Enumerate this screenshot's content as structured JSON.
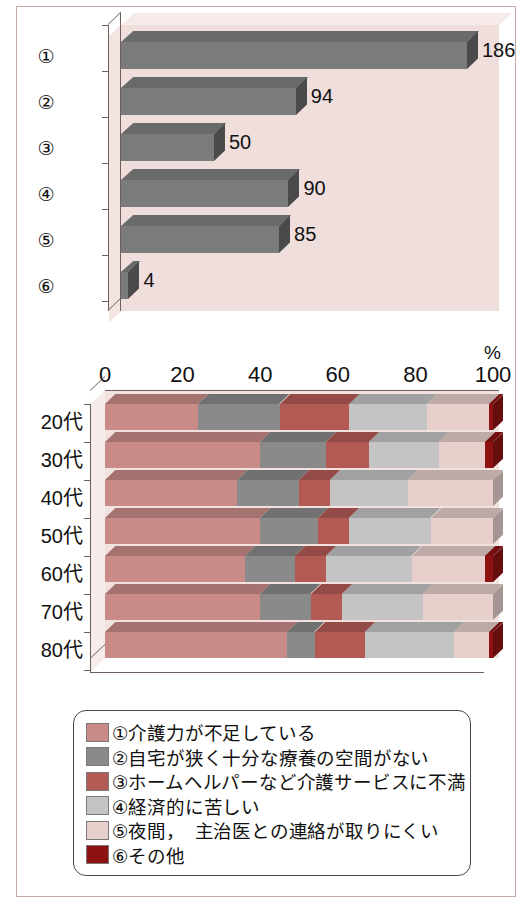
{
  "chart_data": [
    {
      "type": "bar",
      "title": "",
      "orientation": "horizontal",
      "categories": [
        "①",
        "②",
        "③",
        "④",
        "⑤",
        "⑥"
      ],
      "values": [
        186,
        94,
        50,
        90,
        85,
        4
      ],
      "value_labels": [
        "186",
        "94",
        "50",
        "90",
        "85",
        "4"
      ],
      "xlabel": "",
      "ylabel": "",
      "xlim": [
        0,
        200
      ],
      "grid": false,
      "legend": false,
      "bar_color": "#7b7b7b",
      "plot_background": "#efdedc"
    },
    {
      "type": "bar",
      "subtype": "stacked-100",
      "orientation": "horizontal",
      "title": "",
      "xlabel": "",
      "unit_label": "%",
      "categories": [
        "20代",
        "30代",
        "40代",
        "50代",
        "60代",
        "70代",
        "80代"
      ],
      "xticks": [
        0,
        20,
        40,
        60,
        80,
        100
      ],
      "xtick_labels": [
        "0",
        "20",
        "40",
        "60",
        "80",
        "100"
      ],
      "xlim": [
        0,
        100
      ],
      "grid": false,
      "legend": true,
      "legend_position": "below",
      "series": [
        {
          "name": "①介護力が不足している",
          "color": "#c98b88",
          "values": [
            24,
            40,
            34,
            40,
            36,
            40,
            47
          ]
        },
        {
          "name": "②自宅が狭く十分な療養の空間がない",
          "color": "#8a8a8a",
          "values": [
            21,
            17,
            16,
            15,
            13,
            13,
            7
          ]
        },
        {
          "name": "③ホームヘルパーなど介護サービスに不満",
          "color": "#b45a55",
          "values": [
            18,
            11,
            8,
            8,
            8,
            8,
            13
          ]
        },
        {
          "name": "④経済的に苦しい",
          "color": "#c4c4c4",
          "values": [
            20,
            18,
            20,
            21,
            22,
            21,
            23
          ]
        },
        {
          "name": "⑤夜間，　主治医との連絡が取りにくい",
          "color": "#e7cfcc",
          "values": [
            16,
            12,
            22,
            16,
            19,
            18,
            9
          ]
        },
        {
          "name": "⑥その他",
          "color": "#8e1212",
          "values": [
            1,
            2,
            0,
            0,
            2,
            0,
            1
          ]
        }
      ]
    }
  ],
  "top_chart": {
    "categories": [
      "①",
      "②",
      "③",
      "④",
      "⑤",
      "⑥"
    ],
    "values": [
      "186",
      "94",
      "50",
      "90",
      "85",
      "4"
    ]
  },
  "bottom_chart": {
    "unit": "%",
    "xtick_labels": [
      "0",
      "20",
      "40",
      "60",
      "80",
      "100"
    ],
    "categories": [
      "20代",
      "30代",
      "40代",
      "50代",
      "60代",
      "70代",
      "80代"
    ]
  },
  "legend": {
    "items": [
      {
        "label": "①介護力が不足している",
        "color": "#c98b88"
      },
      {
        "label": "②自宅が狭く十分な療養の空間がない",
        "color": "#8a8a8a"
      },
      {
        "label": "③ホームヘルパーなど介護サービスに不満",
        "color": "#b45a55"
      },
      {
        "label": "④経済的に苦しい",
        "color": "#c4c4c4"
      },
      {
        "label": "⑤夜間，　主治医との連絡が取りにくい",
        "color": "#e7cfcc"
      },
      {
        "label": "⑥その他",
        "color": "#8e1212"
      }
    ]
  }
}
